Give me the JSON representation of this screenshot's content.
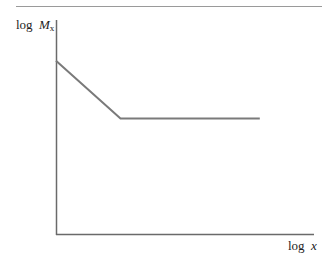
{
  "chart_data": {
    "type": "line",
    "title": "",
    "xlabel": "log x",
    "ylabel": "log M",
    "ylabel_subscript": "x",
    "grid": false,
    "legend": null,
    "axis_ticks": "none",
    "series": [
      {
        "name": "log Mx vs log x",
        "description": "Straight-line decrease followed by a flat plateau",
        "points_normalized": [
          {
            "x": 0.0,
            "y": 0.81
          },
          {
            "x": 0.25,
            "y": 0.54
          },
          {
            "x": 0.79,
            "y": 0.54
          }
        ]
      }
    ],
    "colors": {
      "curve": "#7a7a7a",
      "axes": "#6a6a6a",
      "rule": "#9a9a9a"
    }
  },
  "labels": {
    "y_axis_log": "log",
    "y_axis_var": "M",
    "y_axis_sub": "x",
    "x_axis_log": "log",
    "x_axis_var": "x"
  }
}
